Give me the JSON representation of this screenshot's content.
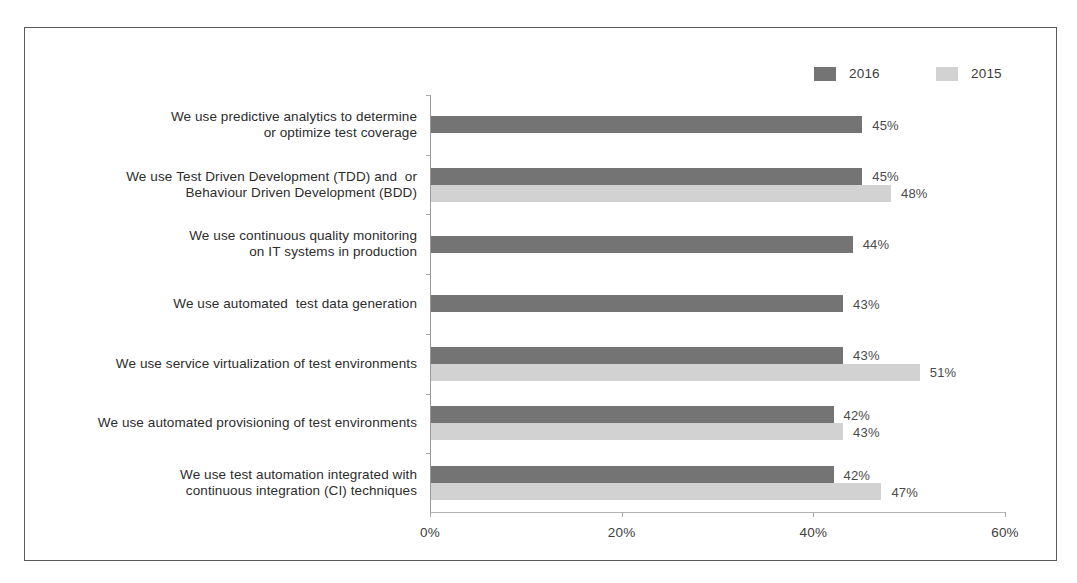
{
  "chart_data": {
    "type": "bar",
    "orientation": "horizontal",
    "title": "",
    "subtitle": "",
    "xlabel": "",
    "ylabel": "",
    "xlim": [
      0,
      60
    ],
    "xticks": [
      0,
      20,
      40,
      60
    ],
    "xtick_labels": [
      "0%",
      "20%",
      "40%",
      "60%"
    ],
    "grid": false,
    "legend_position": "top-right",
    "value_suffix": "%",
    "categories": [
      "We use predictive analytics to determine or optimize test coverage",
      "We use Test Driven Development (TDD) and  or Behaviour Driven Development (BDD)",
      "We use continuous quality monitoring on IT systems in production",
      "We use automated  test data generation",
      "We use service virtualization of test environments",
      "We use automated provisioning of test environments",
      "We use test automation integrated with continuous integration (CI) techniques"
    ],
    "category_lines": [
      [
        "We use predictive analytics to determine",
        "or optimize test coverage"
      ],
      [
        "We use Test Driven Development (TDD) and  or",
        "Behaviour Driven Development (BDD)"
      ],
      [
        "We use continuous quality monitoring",
        "on IT systems in production"
      ],
      [
        "We use automated  test data generation"
      ],
      [
        "We use service virtualization of test environments"
      ],
      [
        "We use automated provisioning of test environments"
      ],
      [
        "We use test automation integrated with",
        "continuous integration (CI) techniques"
      ]
    ],
    "series": [
      {
        "name": "2016",
        "color": "#747474",
        "values": [
          45,
          45,
          44,
          43,
          43,
          42,
          42
        ],
        "labels": [
          "45%",
          "45%",
          "44%",
          "43%",
          "43%",
          "42%",
          "42%"
        ]
      },
      {
        "name": "2015",
        "color": "#d2d2d2",
        "values": [
          null,
          48,
          null,
          null,
          51,
          43,
          47
        ],
        "labels": [
          "",
          "48%",
          "",
          "",
          "51%",
          "43%",
          "47%"
        ]
      }
    ]
  },
  "legend": {
    "items": [
      {
        "label": "2016",
        "color": "#747474"
      },
      {
        "label": "2015",
        "color": "#d2d2d2"
      }
    ]
  },
  "axis": {
    "x_tick_labels": [
      "0%",
      "20%",
      "40%",
      "60%"
    ]
  },
  "colors": {
    "series_2016": "#747474",
    "series_2015": "#d2d2d2",
    "frame_border": "#5a5a5a",
    "axis_line": "#9a9a9a",
    "text": "#2c2c2c"
  }
}
